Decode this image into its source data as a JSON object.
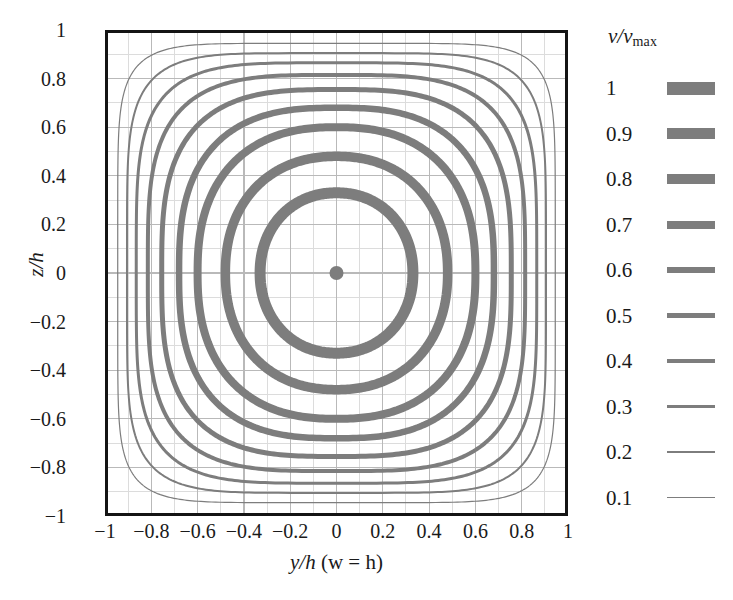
{
  "figure": {
    "type": "contour-plot"
  },
  "axes": {
    "x": {
      "label_parts": {
        "var": "y/h",
        "paren": " (w = h)"
      },
      "label_full": "y/h (w = h)",
      "ticks": [
        "−1",
        "−0.8",
        "−0.6",
        "−0.4",
        "−0.2",
        "0",
        "0.2",
        "0.4",
        "0.6",
        "0.8",
        "1"
      ],
      "tick_values": [
        -1,
        -0.8,
        -0.6,
        -0.4,
        -0.2,
        0,
        0.2,
        0.4,
        0.6,
        0.8,
        1
      ],
      "range": [
        -1,
        1
      ]
    },
    "y": {
      "label_full": "z/h",
      "ticks": [
        "1",
        "0.8",
        "0.6",
        "0.4",
        "0.2",
        "0",
        "−0.2",
        "−0.4",
        "−0.6",
        "−0.8",
        "−1"
      ],
      "tick_values": [
        1,
        0.8,
        0.6,
        0.4,
        0.2,
        0,
        -0.2,
        -0.4,
        -0.6,
        -0.8,
        -1
      ],
      "range": [
        -1,
        1
      ]
    },
    "grid": "on",
    "grid_color": "#b9b9b9",
    "minor_grid_color": "#dcdcdc",
    "frame_color": "#141414"
  },
  "legend": {
    "title_var": "v/v",
    "title_sub": "max",
    "title_full": "v/vmax",
    "position": "right",
    "swatch_color": "#7d7d7d",
    "entries": [
      {
        "label": "1",
        "value": 1,
        "line_width": 13
      },
      {
        "label": "0.9",
        "value": 0.9,
        "line_width": 11
      },
      {
        "label": "0.8",
        "value": 0.8,
        "line_width": 9.5
      },
      {
        "label": "0.7",
        "value": 0.7,
        "line_width": 8
      },
      {
        "label": "0.6",
        "value": 0.6,
        "line_width": 6.5
      },
      {
        "label": "0.5",
        "value": 0.5,
        "line_width": 5
      },
      {
        "label": "0.4",
        "value": 0.4,
        "line_width": 4
      },
      {
        "label": "0.3",
        "value": 0.3,
        "line_width": 3
      },
      {
        "label": "0.2",
        "value": 0.2,
        "line_width": 2
      },
      {
        "label": "0.1",
        "value": 0.1,
        "line_width": 1.2
      }
    ]
  },
  "chart_data": {
    "type": "contour",
    "title": "",
    "xlabel": "y/h (w = h)",
    "ylabel": "z/h",
    "xlim": [
      -1,
      1
    ],
    "ylim": [
      -1,
      1
    ],
    "grid": true,
    "legend_position": "right",
    "legend_title": "v/vmax",
    "contour_color": "#7d7d7d",
    "levels": [
      1,
      0.9,
      0.8,
      0.7,
      0.6,
      0.5,
      0.4,
      0.3,
      0.2,
      0.1
    ],
    "level_labels": [
      "1",
      "0.9",
      "0.8",
      "0.7",
      "0.6",
      "0.5",
      "0.4",
      "0.3",
      "0.2",
      "0.1"
    ],
    "center": [
      0,
      0
    ],
    "note": "Closed superelliptic contours centered at origin; contour line weight decreases with level value; v/vmax = 1 is the single point at the duct centre.",
    "contours": [
      {
        "level": 1,
        "half_extent": 0.03,
        "exponent": 2.0,
        "line_width": 13,
        "shape": "point"
      },
      {
        "level": 0.9,
        "half_extent": 0.33,
        "exponent": 2.1,
        "line_width": 11,
        "shape": "near-circle"
      },
      {
        "level": 0.8,
        "half_extent": 0.48,
        "exponent": 2.2,
        "line_width": 9.5,
        "shape": "near-circle"
      },
      {
        "level": 0.7,
        "half_extent": 0.6,
        "exponent": 2.4,
        "line_width": 8,
        "shape": "rounded-square"
      },
      {
        "level": 0.6,
        "half_extent": 0.68,
        "exponent": 2.7,
        "line_width": 6.5,
        "shape": "rounded-square"
      },
      {
        "level": 0.5,
        "half_extent": 0.755,
        "exponent": 3.1,
        "line_width": 5,
        "shape": "rounded-square"
      },
      {
        "level": 0.4,
        "half_extent": 0.815,
        "exponent": 3.6,
        "line_width": 4,
        "shape": "rounded-square"
      },
      {
        "level": 0.3,
        "half_extent": 0.865,
        "exponent": 4.3,
        "line_width": 3,
        "shape": "rounded-square"
      },
      {
        "level": 0.2,
        "half_extent": 0.905,
        "exponent": 5.4,
        "line_width": 2,
        "shape": "squircle"
      },
      {
        "level": 0.1,
        "half_extent": 0.945,
        "exponent": 7.0,
        "line_width": 1.2,
        "shape": "squircle"
      }
    ]
  }
}
